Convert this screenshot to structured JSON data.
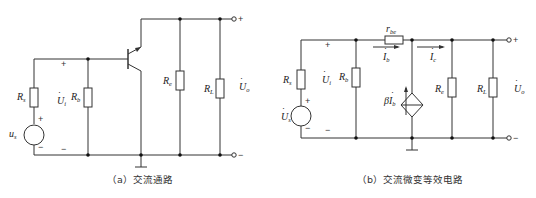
{
  "figure_a": {
    "caption": "（a）交流通路",
    "labels": {
      "Rs": "R",
      "Rs_sub": "s",
      "Rb": "R",
      "Rb_sub": "b",
      "Re": "R",
      "Re_sub": "e",
      "RL": "R",
      "RL_sub": "L",
      "us": "u",
      "us_sub": "s",
      "Ui": "U",
      "Ui_sub": "i",
      "Uo": "U",
      "Uo_sub": "o"
    },
    "plus": "+",
    "minus": "−",
    "out_plus": "+",
    "out_minus": "−"
  },
  "figure_b": {
    "caption": "（b）交流微变等效电路",
    "labels": {
      "Rs": "R",
      "Rs_sub": "s",
      "Rb": "R",
      "Rb_sub": "b",
      "rbe": "r",
      "rbe_sub": "be",
      "Ib": "I",
      "Ib_sub": "b",
      "Ic": "I",
      "Ic_sub": "c",
      "beta": "β",
      "betaI": "I",
      "betaI_sub": "b",
      "Re": "R",
      "Re_sub": "e",
      "RL": "R",
      "RL_sub": "L",
      "Us": "U",
      "Us_sub": "s",
      "Ui": "U",
      "Ui_sub": "i",
      "Uo": "U",
      "Uo_sub": "o"
    },
    "plus": "+",
    "minus": "−",
    "out_plus": "+",
    "out_minus": "−"
  },
  "colors": {
    "wire": "#333333",
    "background": "#ffffff"
  }
}
